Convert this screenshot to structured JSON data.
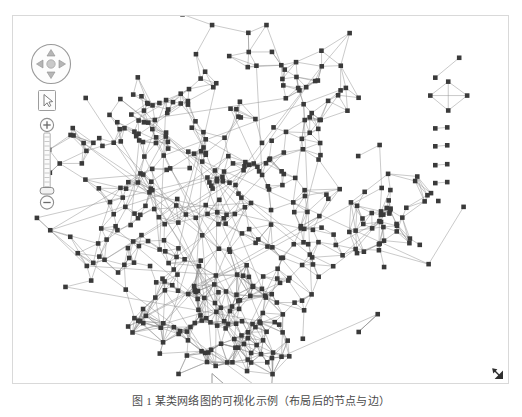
{
  "app": {
    "title": "Network Graph Viewer",
    "background_color": "#ffffff",
    "frame_border_color": "#d9d9d9"
  },
  "toolbar": {
    "pan_control": {
      "name": "pan-control",
      "up_label": "Pan up",
      "down_label": "Pan down",
      "left_label": "Pan left",
      "right_label": "Pan right",
      "center_label": "Center"
    },
    "select_tool": {
      "name": "select-tool",
      "label": "Select",
      "active": true
    },
    "zoom_slider": {
      "name": "zoom-slider",
      "zoom_in_label": "+",
      "zoom_out_label": "−",
      "ticks": 12,
      "handle_position_percent": 18,
      "zoom_level": "18"
    }
  },
  "graph": {
    "node_color": "#3a3a3a",
    "edge_color": "#8c8c8c",
    "node_size": 2.4,
    "edge_width": 0.55,
    "main_component_label": "main-network-cluster",
    "satellite_component_label": "satellite-cluster",
    "isolated_components": [
      {
        "label": "dyad-component-1",
        "nodes": 2,
        "edges": 1
      },
      {
        "label": "k4-component",
        "nodes": 4,
        "edges": 6
      },
      {
        "label": "dyad-component-2",
        "nodes": 2,
        "edges": 1
      },
      {
        "label": "dyad-component-3",
        "nodes": 2,
        "edges": 1
      },
      {
        "label": "dyad-component-4",
        "nodes": 2,
        "edges": 1
      },
      {
        "label": "dyad-component-5",
        "nodes": 2,
        "edges": 1
      },
      {
        "label": "singleton-component",
        "nodes": 1,
        "edges": 0
      }
    ]
  },
  "chart_data": {
    "type": "scatter",
    "title": "",
    "xlabel": "",
    "ylabel": "",
    "node_count": 430,
    "edge_count": 1180,
    "component_count": 9,
    "grid": false,
    "legend": "none"
  },
  "statusbar": {
    "resize_handle_label": "Resize"
  },
  "caption": {
    "text": "图 1   某类网络图的可视化示例（布局后的节点与边）"
  }
}
